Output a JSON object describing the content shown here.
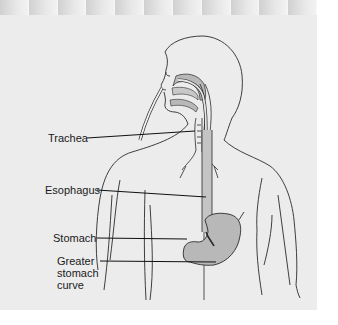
{
  "figure": {
    "labels": [
      {
        "id": "trachea",
        "text": "Trachea"
      },
      {
        "id": "esophagus",
        "text": "Esophagus"
      },
      {
        "id": "stomach",
        "text": "Stomach"
      },
      {
        "id": "greater-curve",
        "lines": [
          "Greater",
          "stomach",
          "curve"
        ]
      }
    ]
  },
  "colors": {
    "page_background": "#ececec",
    "outline": "#2a2a2a",
    "organ_fill": "#b8b8b8",
    "leader_line": "#111111"
  }
}
